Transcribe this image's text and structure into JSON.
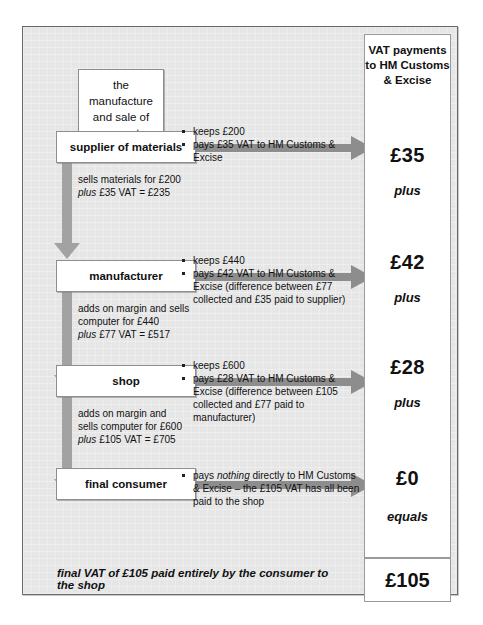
{
  "diagram": {
    "title_box": {
      "lines": [
        "the",
        "manufacture",
        "and sale of",
        "a computer"
      ]
    },
    "vat_column": {
      "heading": "VAT payments to HM Customs & Excise",
      "entries": [
        {
          "amount": "£35",
          "operator": "plus"
        },
        {
          "amount": "£42",
          "operator": "plus"
        },
        {
          "amount": "£28",
          "operator": "plus"
        },
        {
          "amount": "£0",
          "operator": "equals"
        }
      ],
      "total": "£105"
    },
    "stages": [
      {
        "name": "supplier of materials",
        "note_line1": "sells materials for £200",
        "note_line2_italic": "plus",
        "note_line2_rest": " £35 VAT = £235",
        "bullets": [
          "keeps £200",
          "pays £35 VAT to HM Customs & Excise"
        ],
        "vat_paid": "£35"
      },
      {
        "name": "manufacturer",
        "note_line1": "adds on margin and sells",
        "note_line1b": "computer for £440",
        "note_line2_italic": "plus",
        "note_line2_rest": " £77 VAT = £517",
        "bullets": [
          "keeps £440",
          "pays £42 VAT to HM Customs & Excise (difference between £77 collected and £35 paid to supplier)"
        ],
        "vat_paid": "£42"
      },
      {
        "name": "shop",
        "note_line1": "adds on margin and",
        "note_line1b": "sells computer for £600",
        "note_line2_italic": "plus",
        "note_line2_rest": " £105 VAT = £705",
        "bullets": [
          "keeps £600",
          "pays £28 VAT to HM Customs & Excise (difference between £105 collected and £77 paid to manufacturer)"
        ],
        "vat_paid": "£28"
      },
      {
        "name": "final consumer",
        "bullet_prefix": "pays ",
        "bullet_emphasis": "nothing",
        "bullet_suffix": " directly to HM Customs & Excise – the £105 VAT has all been paid to the shop",
        "vat_paid": "£0"
      }
    ],
    "summary": "final VAT of £105 paid entirely by the consumer to the shop",
    "colors": {
      "panel_background": "#e6e6e6",
      "panel_border": "#6b6b6b",
      "box_background": "#ffffff",
      "box_border": "#8e8e8e",
      "horizontal_arrow": "#8d8d8d",
      "vertical_arrow": "#a2a2a2",
      "text": "#111111"
    }
  }
}
